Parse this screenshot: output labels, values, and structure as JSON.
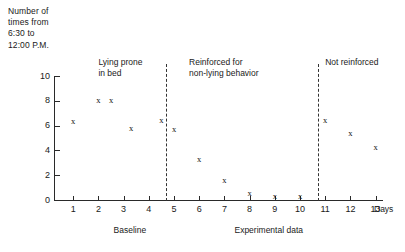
{
  "chart_data": {
    "type": "scatter",
    "title": "",
    "ylabel": "Number of\ntimes from\n6:30 to\n12:00 P.M.",
    "xlabel": "Days",
    "xlim": [
      0,
      13.6
    ],
    "ylim": [
      0,
      10
    ],
    "grid": false,
    "legend": "none",
    "marker_glyph": "x",
    "y_ticks": [
      0,
      2,
      4,
      6,
      8,
      10
    ],
    "x_ticks": [
      1,
      2,
      3,
      4,
      5,
      6,
      7,
      8,
      9,
      10,
      11,
      12,
      13
    ],
    "x": [
      1,
      2,
      2.5,
      3.3,
      4.5,
      5,
      6,
      7,
      8,
      9,
      10,
      11,
      12,
      13
    ],
    "values": [
      6.3,
      8.0,
      8.0,
      5.8,
      6.4,
      5.7,
      3.3,
      1.6,
      0.5,
      0.3,
      0.3,
      6.4,
      5.4,
      4.2
    ],
    "points": [
      {
        "x": 1,
        "y": 6.3,
        "phase": "Baseline"
      },
      {
        "x": 2,
        "y": 8.0,
        "phase": "Baseline"
      },
      {
        "x": 2.5,
        "y": 8.0,
        "phase": "Baseline"
      },
      {
        "x": 3.3,
        "y": 5.8,
        "phase": "Baseline"
      },
      {
        "x": 4.5,
        "y": 6.4,
        "phase": "Baseline"
      },
      {
        "x": 5,
        "y": 5.7,
        "phase": "Reinforced for non-lying behavior"
      },
      {
        "x": 6,
        "y": 3.3,
        "phase": "Reinforced for non-lying behavior"
      },
      {
        "x": 7,
        "y": 1.6,
        "phase": "Reinforced for non-lying behavior"
      },
      {
        "x": 8,
        "y": 0.5,
        "phase": "Reinforced for non-lying behavior"
      },
      {
        "x": 9,
        "y": 0.3,
        "phase": "Reinforced for non-lying behavior"
      },
      {
        "x": 10,
        "y": 0.3,
        "phase": "Reinforced for non-lying behavior"
      },
      {
        "x": 11,
        "y": 6.4,
        "phase": "Not reinforced"
      },
      {
        "x": 12,
        "y": 5.4,
        "phase": "Not reinforced"
      },
      {
        "x": 13,
        "y": 4.2,
        "phase": "Not reinforced"
      }
    ],
    "dividers": [
      4.7,
      10.7
    ],
    "annotations": [
      {
        "text": "Lying prone\nin bed",
        "x": 2.0
      },
      {
        "text": "Reinforced for\nnon-lying behavior",
        "x": 5.6
      },
      {
        "text": "Not reinforced",
        "x": 11.0
      }
    ],
    "section_captions": [
      {
        "text": "Baseline",
        "x": 2.6
      },
      {
        "text": "Experimental data",
        "x": 7.4
      }
    ]
  }
}
